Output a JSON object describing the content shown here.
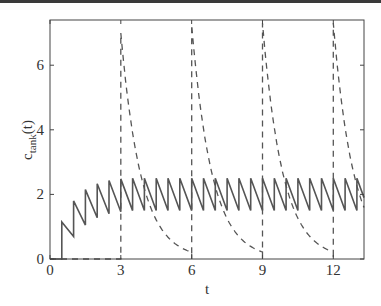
{
  "chart_data": {
    "type": "line",
    "title": "",
    "xlabel": "t",
    "ylabel": "c_tank(t)",
    "ylabel_main": "c",
    "ylabel_sub": "tank",
    "ylabel_suffix": "(t)",
    "xlim": [
      0,
      13.3
    ],
    "ylim": [
      0,
      7.4
    ],
    "xticks": [
      0,
      3,
      6,
      9,
      12
    ],
    "yticks": [
      0,
      2,
      4,
      6
    ],
    "grid": false,
    "legend": null,
    "series": [
      {
        "name": "solid (sawtooth, dose every 0.5)",
        "style": "solid",
        "color": "#555555",
        "x": [
          0,
          0.5,
          0.5,
          1.0,
          1.0,
          1.5,
          1.5,
          2.0,
          2.0,
          2.5,
          2.5,
          3.0,
          3.0,
          3.5,
          3.5,
          4.0,
          4.0,
          4.5,
          4.5,
          5.0,
          5.0,
          5.5,
          5.5,
          6.0,
          6.0,
          6.5,
          6.5,
          7.0,
          7.0,
          7.5,
          7.5,
          8.0,
          8.0,
          8.5,
          8.5,
          9.0,
          9.0,
          9.5,
          9.5,
          10.0,
          10.0,
          10.5,
          10.5,
          11.0,
          11.0,
          11.5,
          11.5,
          12.0,
          12.0,
          12.5,
          12.5,
          13.0,
          13.0,
          13.3
        ],
        "y": [
          0,
          0,
          1.15,
          0.7,
          1.8,
          1.05,
          2.15,
          1.28,
          2.33,
          1.4,
          2.43,
          1.46,
          2.48,
          1.5,
          2.5,
          1.5,
          2.5,
          1.5,
          2.5,
          1.5,
          2.5,
          1.5,
          2.5,
          1.5,
          2.5,
          1.5,
          2.5,
          1.5,
          2.5,
          1.5,
          2.5,
          1.5,
          2.5,
          1.5,
          2.5,
          1.5,
          2.5,
          1.5,
          2.5,
          1.5,
          2.5,
          1.5,
          2.5,
          1.5,
          2.5,
          1.5,
          2.5,
          1.5,
          2.5,
          1.5,
          2.5,
          1.5,
          2.5,
          1.9
        ]
      },
      {
        "name": "dashed (bolus every 3)",
        "style": "dashed",
        "color": "#555555",
        "pulses": [
          {
            "t0": 3,
            "peak": 7.0
          },
          {
            "t0": 6,
            "peak": 7.25
          },
          {
            "t0": 9,
            "peak": 7.3
          },
          {
            "t0": 12,
            "peak": 7.3
          }
        ],
        "decay_rate": 1.17,
        "value_before_first_pulse": 0,
        "trough_before_next_pulse": 0.2
      }
    ]
  }
}
